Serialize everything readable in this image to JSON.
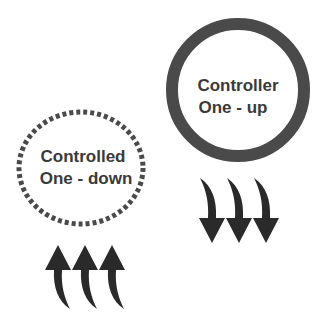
{
  "diagram": {
    "controller": {
      "line1": "Controller",
      "line2": "One - up",
      "border_style": "solid",
      "arrows_direction": "down",
      "arrow_count": 3
    },
    "controlled": {
      "line1": "Controlled",
      "line2": "One - down",
      "border_style": "dotted",
      "arrows_direction": "up",
      "arrow_count": 3
    },
    "colors": {
      "ring": "#4a4a4a",
      "arrow": "#2a2a2a",
      "text": "#3a3a3a",
      "background": "#ffffff"
    }
  }
}
